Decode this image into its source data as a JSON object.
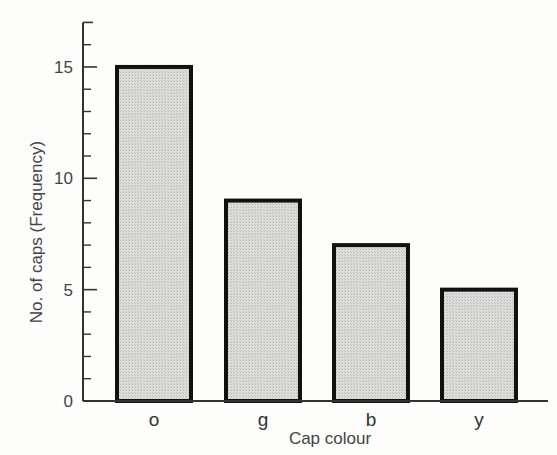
{
  "chart_data": {
    "type": "bar",
    "title": "",
    "categories": [
      "o",
      "g",
      "b",
      "y"
    ],
    "values": [
      15,
      9,
      7,
      5
    ],
    "xlabel": "Cap colour",
    "ylabel": "No. of caps (Frequency)",
    "ylim": [
      0,
      17
    ],
    "yticks_major": [
      0,
      5,
      10,
      15
    ],
    "yticks_minor_step": 1,
    "grid": false,
    "legend": null,
    "bar_fill": "#d8d8d6",
    "bar_stroke": "#111111"
  }
}
